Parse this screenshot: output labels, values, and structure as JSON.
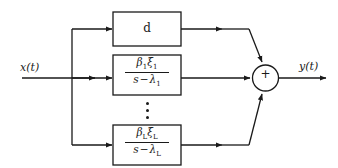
{
  "figure": {
    "type": "signal-flow-block-diagram",
    "background_color": "#ffffff",
    "line_color": "#1a1a1a",
    "input": {
      "label": "x(t)",
      "name": "input-signal"
    },
    "output": {
      "label": "y(t)",
      "name": "output-signal"
    },
    "summing_junction": {
      "symbol": "+",
      "shape": "circle",
      "inputs": 3
    },
    "ellipsis": {
      "symbol": "vertical-dots",
      "count": 3,
      "meaning": "additional parallel branches 2 through L-1"
    },
    "branches": [
      {
        "id": "feedthrough",
        "name": "direct-gain-block",
        "kind": "gain",
        "label": "d"
      },
      {
        "id": "pole-1",
        "name": "first-order-section-1",
        "kind": "transfer-function",
        "numerator": {
          "beta": "β",
          "beta_subscript": "1",
          "xi": "ξ",
          "xi_subscript": "1"
        },
        "denominator": {
          "variable": "s",
          "operator": "−",
          "lambda": "λ",
          "lambda_subscript": "1"
        }
      },
      {
        "id": "pole-L",
        "name": "first-order-section-L",
        "kind": "transfer-function",
        "numerator": {
          "beta": "β",
          "beta_subscript": "L",
          "xi": "ξ",
          "xi_subscript": "L"
        },
        "denominator": {
          "variable": "s",
          "operator": "−",
          "lambda": "λ",
          "lambda_subscript": "L"
        }
      }
    ]
  }
}
